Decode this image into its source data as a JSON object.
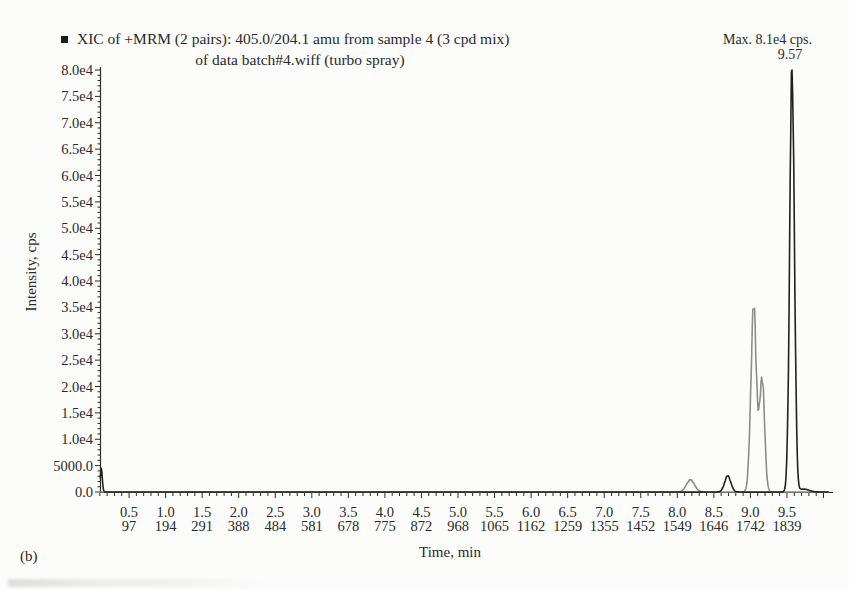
{
  "figure": {
    "panel_label": "(b)"
  },
  "legend": {
    "marker_glyph": "■",
    "line1": "XIC of +MRM (2 pairs): 405.0/204.1 amu from sample 4 (3 cpd mix)",
    "line2": "of data batch#4.wiff (turbo spray)"
  },
  "annotations": {
    "max_label": "Max. 8.1e4 cps.",
    "peak_time_label": "9.57"
  },
  "chart_data": {
    "type": "line",
    "xlabel": "Time, min",
    "ylabel": "Intensity, cps",
    "xlim": [
      0,
      10.1
    ],
    "ylim": [
      0,
      80000
    ],
    "grid": false,
    "legend_position": "top-left",
    "axis_color": "#2b2b2b",
    "max_intensity_cps": 81000,
    "max_peak_time_min": 9.57,
    "x_ticks": [
      {
        "t": 0.5,
        "label": "0.5",
        "scan": "97"
      },
      {
        "t": 1.0,
        "label": "1.0",
        "scan": "194"
      },
      {
        "t": 1.5,
        "label": "1.5",
        "scan": "291"
      },
      {
        "t": 2.0,
        "label": "2.0",
        "scan": "388"
      },
      {
        "t": 2.5,
        "label": "2.5",
        "scan": "484"
      },
      {
        "t": 3.0,
        "label": "3.0",
        "scan": "581"
      },
      {
        "t": 3.5,
        "label": "3.5",
        "scan": "678"
      },
      {
        "t": 4.0,
        "label": "4.0",
        "scan": "775"
      },
      {
        "t": 4.5,
        "label": "4.5",
        "scan": "872"
      },
      {
        "t": 5.0,
        "label": "5.0",
        "scan": "968"
      },
      {
        "t": 5.5,
        "label": "5.5",
        "scan": "1065"
      },
      {
        "t": 6.0,
        "label": "6.0",
        "scan": "1162"
      },
      {
        "t": 6.5,
        "label": "6.5",
        "scan": "1259"
      },
      {
        "t": 7.0,
        "label": "7.0",
        "scan": "1355"
      },
      {
        "t": 7.5,
        "label": "7.5",
        "scan": "1452"
      },
      {
        "t": 8.0,
        "label": "8.0",
        "scan": "1549"
      },
      {
        "t": 8.5,
        "label": "8.5",
        "scan": "1646"
      },
      {
        "t": 9.0,
        "label": "9.0",
        "scan": "1742"
      },
      {
        "t": 9.5,
        "label": "9.5",
        "scan": "1839"
      }
    ],
    "y_ticks": [
      {
        "label": "0.0",
        "value": 0
      },
      {
        "label": "5000.0",
        "value": 5000
      },
      {
        "label": "1.0e4",
        "value": 10000
      },
      {
        "label": "1.5e4",
        "value": 15000
      },
      {
        "label": "2.0e4",
        "value": 20000
      },
      {
        "label": "2.5e4",
        "value": 25000
      },
      {
        "label": "3.0e4",
        "value": 30000
      },
      {
        "label": "3.5e4",
        "value": 35000
      },
      {
        "label": "4.0e4",
        "value": 40000
      },
      {
        "label": "4.5e4",
        "value": 45000
      },
      {
        "label": "5.0e4",
        "value": 50000
      },
      {
        "label": "5.5e4",
        "value": 55000
      },
      {
        "label": "6.0e4",
        "value": 60000
      },
      {
        "label": "6.5e4",
        "value": 65000
      },
      {
        "label": "7.0e4",
        "value": 70000
      },
      {
        "label": "7.5e4",
        "value": 75000
      },
      {
        "label": "8.0e4",
        "value": 80000
      }
    ],
    "series": [
      {
        "name": "mrm-pair-gray-trace",
        "color": "#8d8d8d",
        "peaks": [
          {
            "t": 8.18,
            "height": 2300,
            "sigma": 0.055
          },
          {
            "t": 9.045,
            "height": 35000,
            "sigma": 0.038
          },
          {
            "t": 9.16,
            "height": 21500,
            "sigma": 0.034
          }
        ]
      },
      {
        "name": "mrm-pair-black-trace",
        "color": "#202020",
        "peaks": [
          {
            "t": 0.12,
            "height": 4500,
            "sigma": 0.014
          },
          {
            "t": 8.69,
            "height": 3050,
            "sigma": 0.042
          },
          {
            "t": 9.57,
            "height": 80500,
            "sigma": 0.032
          },
          {
            "t": 9.73,
            "height": 550,
            "sigma": 0.07
          }
        ]
      }
    ]
  }
}
